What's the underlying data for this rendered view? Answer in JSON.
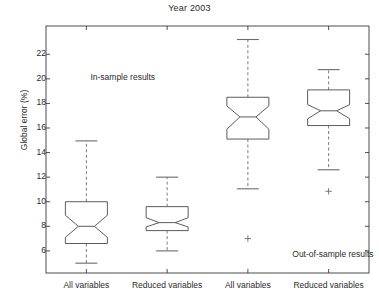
{
  "chart_data": {
    "type": "box",
    "title": "Year 2003",
    "xlabel": "",
    "ylabel": "Global error (%)",
    "ylim": [
      4.2,
      24.3
    ],
    "yticks": [
      6,
      8,
      10,
      12,
      14,
      16,
      18,
      20,
      22
    ],
    "ytick_labels": [
      "6",
      "8",
      "10",
      "12",
      "14",
      "16",
      "18",
      "20",
      "22"
    ],
    "grid": false,
    "legend": "none",
    "notched": true,
    "categories": [
      "All variables",
      "Reduced variables",
      "All variables",
      "Reduced variables"
    ],
    "groups": [
      {
        "name": "In-sample results",
        "categories": [
          "All variables",
          "Reduced variables"
        ]
      },
      {
        "name": "Out-of-sample results",
        "categories": [
          "All variables",
          "Reduced variables"
        ]
      }
    ],
    "boxes": [
      {
        "label": "All variables",
        "group": "In-sample results",
        "q1": 6.6,
        "median": 8.0,
        "q3": 10.0,
        "whisker_low": 5.0,
        "whisker_high": 14.95,
        "notch_low": 7.1,
        "notch_high": 8.9,
        "outliers": []
      },
      {
        "label": "Reduced variables",
        "group": "In-sample results",
        "q1": 7.65,
        "median": 8.3,
        "q3": 9.6,
        "whisker_low": 6.0,
        "whisker_high": 12.0,
        "notch_low": 7.95,
        "notch_high": 8.7,
        "outliers": []
      },
      {
        "label": "All variables",
        "group": "Out-of-sample results",
        "q1": 15.1,
        "median": 16.9,
        "q3": 18.5,
        "whisker_low": 11.05,
        "whisker_high": 23.2,
        "notch_low": 15.9,
        "notch_high": 17.8,
        "outliers": [
          7.0
        ]
      },
      {
        "label": "Reduced variables",
        "group": "Out-of-sample results",
        "q1": 16.2,
        "median": 17.4,
        "q3": 19.1,
        "whisker_low": 12.6,
        "whisker_high": 20.75,
        "notch_low": 16.75,
        "notch_high": 17.9,
        "outliers": [
          10.85
        ]
      }
    ],
    "annotations": [
      {
        "text": "In-sample results",
        "x": 1.05,
        "y": 20.1
      },
      {
        "text": "Out-of-sample results",
        "x": 3.55,
        "y": 5.65
      }
    ],
    "colors": {
      "axis": "#3a3a3a",
      "box": "#4a4a4a",
      "median": "#4a4a4a",
      "whisker": "#6b6b6b",
      "outlier": "#6b6b6b",
      "text": "#2b2b2b",
      "background": "#ffffff"
    }
  }
}
